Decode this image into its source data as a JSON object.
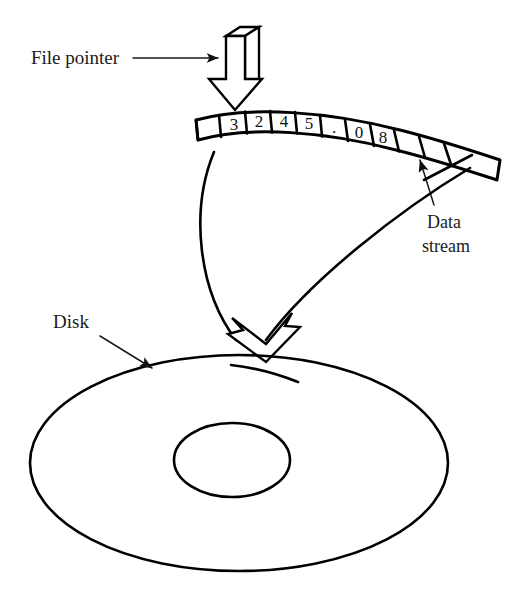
{
  "figure": {
    "width": 517,
    "height": 592,
    "background": "#ffffff",
    "ink_color": "#000000"
  },
  "labels": {
    "file_pointer": "File pointer",
    "disk": "Disk",
    "data_stream_line1": "Data",
    "data_stream_line2": "stream"
  },
  "data_stream": {
    "cells": [
      "",
      "3",
      "2",
      "4",
      "5",
      ".",
      "0",
      "8",
      ""
    ],
    "cell_count": 9,
    "pointer_cell_index": 1,
    "stream_pointer_cell_index": 8
  },
  "icons": {
    "file_pointer_arrow": "block-arrow-down-3d",
    "write_arrow": "hollow-arrow-down",
    "disk_pointer": "line-arrow",
    "stream_pointer": "line-arrow-up"
  },
  "disk": {
    "shape": "ellipse",
    "hole": "ellipse",
    "track_mark": "arc"
  }
}
